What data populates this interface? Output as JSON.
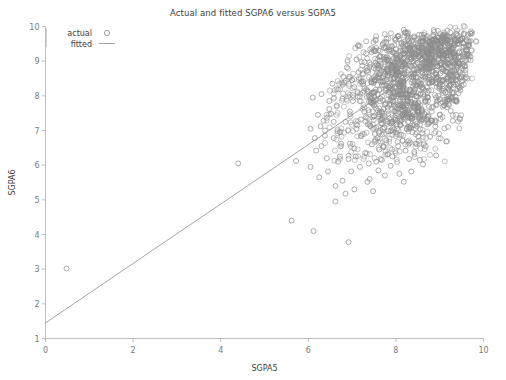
{
  "chart_data": {
    "type": "scatter",
    "title": "Actual and fitted SGPA6 versus SGPA5",
    "xlabel": "SGPA5",
    "ylabel": "SGPA6",
    "xlim": [
      0,
      10
    ],
    "ylim": [
      1,
      10
    ],
    "xticks": [
      0,
      2,
      4,
      6,
      8,
      10
    ],
    "yticks": [
      1,
      2,
      3,
      4,
      5,
      6,
      7,
      8,
      9,
      10
    ],
    "xtick_labels": [
      "0",
      "2",
      "4",
      "6",
      "8",
      "10"
    ],
    "ytick_labels": [
      "1",
      "2",
      "3",
      "4",
      "5",
      "6",
      "7",
      "8",
      "9",
      "10"
    ],
    "grid": false,
    "legend_position": "top-left",
    "marker_color": "#8c8c8c",
    "line_color": "#9a9a9a",
    "axis_color": "#b5b5b5",
    "series": [
      {
        "name": "actual",
        "type": "scatter",
        "marker": "open-circle",
        "points": [
          [
            0.48,
            3.02
          ],
          [
            4.4,
            6.05
          ],
          [
            5.62,
            4.4
          ],
          [
            6.12,
            4.1
          ],
          [
            6.92,
            3.78
          ],
          [
            5.72,
            6.12
          ],
          [
            6.05,
            5.95
          ],
          [
            6.18,
            6.42
          ],
          [
            6.3,
            6.55
          ],
          [
            6.42,
            6.2
          ],
          [
            6.05,
            7.05
          ],
          [
            6.22,
            7.45
          ],
          [
            6.38,
            7.0
          ],
          [
            6.48,
            7.62
          ],
          [
            6.58,
            6.78
          ],
          [
            6.1,
            7.95
          ],
          [
            6.3,
            8.05
          ],
          [
            6.72,
            6.95
          ],
          [
            6.85,
            7.25
          ],
          [
            6.95,
            6.62
          ],
          [
            7.02,
            7.85
          ],
          [
            7.12,
            7.15
          ],
          [
            7.2,
            6.85
          ],
          [
            7.28,
            7.55
          ],
          [
            7.35,
            8.15
          ],
          [
            6.62,
            5.4
          ],
          [
            6.78,
            5.55
          ],
          [
            7.05,
            5.3
          ],
          [
            7.4,
            5.6
          ],
          [
            7.55,
            6.1
          ],
          [
            7.62,
            6.45
          ],
          [
            7.7,
            7.05
          ],
          [
            7.78,
            6.72
          ],
          [
            7.85,
            7.35
          ],
          [
            7.92,
            6.25
          ],
          [
            6.55,
            8.35
          ],
          [
            6.8,
            8.55
          ],
          [
            7.05,
            8.25
          ],
          [
            7.25,
            8.62
          ],
          [
            7.42,
            8.9
          ],
          [
            7.5,
            7.72
          ],
          [
            7.58,
            8.05
          ],
          [
            7.65,
            8.42
          ],
          [
            7.72,
            8.78
          ],
          [
            7.8,
            9.02
          ],
          [
            7.88,
            8.18
          ],
          [
            7.95,
            8.52
          ],
          [
            8.02,
            8.85
          ],
          [
            8.1,
            9.15
          ],
          [
            8.18,
            8.32
          ],
          [
            7.45,
            6.6
          ],
          [
            7.52,
            6.9
          ],
          [
            7.6,
            5.85
          ],
          [
            7.68,
            6.15
          ],
          [
            7.75,
            5.7
          ],
          [
            8.05,
            6.55
          ],
          [
            8.12,
            6.88
          ],
          [
            8.2,
            7.2
          ],
          [
            8.28,
            7.52
          ],
          [
            8.35,
            7.82
          ],
          [
            8.42,
            8.12
          ],
          [
            8.5,
            8.42
          ],
          [
            8.58,
            8.7
          ],
          [
            8.65,
            8.98
          ],
          [
            8.72,
            9.22
          ],
          [
            8.8,
            9.45
          ],
          [
            8.88,
            9.62
          ],
          [
            8.95,
            9.38
          ],
          [
            9.02,
            9.55
          ],
          [
            9.1,
            9.7
          ],
          [
            9.18,
            9.42
          ],
          [
            9.25,
            9.58
          ],
          [
            9.32,
            9.72
          ],
          [
            9.4,
            9.5
          ],
          [
            9.48,
            9.65
          ],
          [
            9.55,
            9.78
          ],
          [
            9.62,
            9.58
          ],
          [
            9.7,
            9.8
          ],
          [
            9.35,
            9.18
          ],
          [
            9.1,
            9.05
          ],
          [
            8.25,
            7.05
          ],
          [
            8.32,
            7.38
          ],
          [
            8.4,
            7.68
          ],
          [
            8.48,
            7.98
          ],
          [
            8.55,
            8.28
          ],
          [
            8.62,
            8.55
          ],
          [
            8.7,
            8.82
          ],
          [
            8.78,
            9.08
          ],
          [
            8.85,
            9.3
          ],
          [
            8.92,
            9.12
          ],
          [
            8.15,
            6.7
          ],
          [
            8.22,
            6.42
          ],
          [
            8.3,
            6.18
          ],
          [
            8.45,
            6.62
          ],
          [
            8.6,
            6.92
          ],
          [
            8.05,
            8.05
          ],
          [
            8.12,
            8.35
          ],
          [
            8.2,
            8.62
          ],
          [
            8.28,
            8.88
          ],
          [
            8.35,
            9.1
          ],
          [
            7.98,
            7.55
          ],
          [
            7.9,
            7.25
          ],
          [
            7.82,
            6.98
          ],
          [
            7.72,
            7.62
          ],
          [
            7.65,
            7.92
          ],
          [
            8.92,
            8.62
          ],
          [
            9.0,
            8.88
          ],
          [
            9.08,
            8.45
          ],
          [
            9.15,
            8.7
          ],
          [
            9.22,
            8.95
          ],
          [
            8.68,
            7.85
          ],
          [
            8.75,
            8.15
          ],
          [
            8.82,
            8.4
          ],
          [
            8.5,
            7.55
          ],
          [
            8.58,
            7.28
          ],
          [
            9.3,
            9.0
          ],
          [
            9.38,
            8.75
          ],
          [
            9.45,
            9.25
          ],
          [
            9.52,
            9.05
          ],
          [
            9.6,
            9.32
          ],
          [
            7.3,
            6.35
          ],
          [
            7.38,
            6.05
          ],
          [
            7.18,
            5.95
          ],
          [
            7.08,
            6.25
          ],
          [
            6.98,
            5.82
          ],
          [
            8.38,
            6.95
          ],
          [
            8.45,
            7.25
          ],
          [
            8.52,
            6.7
          ],
          [
            8.65,
            7.48
          ],
          [
            8.72,
            7.18
          ],
          [
            9.05,
            8.15
          ],
          [
            9.12,
            7.88
          ],
          [
            9.2,
            8.22
          ],
          [
            9.28,
            8.48
          ],
          [
            9.42,
            8.28
          ],
          [
            6.88,
            8.82
          ],
          [
            7.1,
            9.05
          ],
          [
            7.32,
            9.22
          ],
          [
            7.55,
            9.38
          ],
          [
            7.78,
            9.55
          ],
          [
            8.0,
            9.62
          ],
          [
            8.22,
            9.48
          ],
          [
            8.42,
            9.68
          ],
          [
            8.62,
            9.52
          ],
          [
            8.85,
            9.72
          ],
          [
            6.45,
            5.82
          ],
          [
            6.68,
            6.1
          ],
          [
            6.25,
            5.65
          ],
          [
            7.88,
            5.98
          ],
          [
            8.08,
            5.75
          ],
          [
            7.95,
            8.92
          ],
          [
            8.18,
            9.22
          ],
          [
            8.38,
            9.35
          ],
          [
            8.55,
            9.18
          ],
          [
            8.78,
            9.42
          ],
          [
            7.42,
            7.12
          ],
          [
            7.5,
            7.42
          ],
          [
            7.58,
            6.78
          ],
          [
            7.68,
            8.32
          ],
          [
            7.75,
            8.62
          ],
          [
            8.08,
            7.72
          ],
          [
            8.15,
            7.42
          ],
          [
            8.02,
            7.18
          ],
          [
            7.92,
            6.88
          ],
          [
            8.25,
            9.02
          ],
          [
            9.48,
            9.12
          ],
          [
            9.55,
            9.42
          ],
          [
            9.62,
            9.22
          ],
          [
            9.28,
            9.35
          ],
          [
            9.18,
            9.62
          ],
          [
            6.72,
            6.25
          ],
          [
            6.58,
            7.25
          ],
          [
            6.38,
            6.85
          ],
          [
            6.95,
            7.55
          ],
          [
            7.22,
            8.42
          ],
          [
            8.32,
            8.18
          ],
          [
            8.48,
            8.95
          ],
          [
            8.68,
            9.15
          ],
          [
            8.88,
            8.98
          ],
          [
            9.05,
            9.28
          ],
          [
            7.62,
            9.12
          ],
          [
            7.85,
            9.28
          ],
          [
            8.05,
            9.05
          ],
          [
            8.3,
            9.58
          ],
          [
            8.52,
            9.4
          ],
          [
            6.15,
            6.78
          ],
          [
            6.35,
            7.28
          ],
          [
            6.52,
            7.48
          ],
          [
            6.65,
            7.72
          ],
          [
            6.78,
            7.92
          ],
          [
            7.0,
            8.45
          ],
          [
            7.15,
            8.68
          ],
          [
            7.28,
            8.22
          ],
          [
            7.45,
            8.48
          ],
          [
            7.6,
            8.88
          ],
          [
            8.42,
            6.38
          ],
          [
            8.55,
            6.15
          ],
          [
            8.68,
            6.55
          ],
          [
            8.78,
            6.82
          ],
          [
            8.9,
            7.12
          ],
          [
            9.0,
            7.45
          ],
          [
            9.1,
            7.72
          ],
          [
            9.2,
            7.98
          ],
          [
            9.32,
            8.08
          ],
          [
            9.4,
            8.55
          ],
          [
            7.35,
            5.52
          ],
          [
            7.48,
            5.25
          ],
          [
            6.85,
            5.18
          ],
          [
            6.62,
            4.95
          ],
          [
            8.18,
            5.52
          ],
          [
            8.35,
            5.82
          ],
          [
            8.62,
            6.02
          ],
          [
            8.92,
            6.28
          ],
          [
            9.15,
            6.68
          ],
          [
            9.3,
            7.28
          ],
          [
            7.1,
            7.05
          ],
          [
            7.2,
            7.32
          ],
          [
            7.05,
            6.48
          ],
          [
            6.92,
            6.18
          ],
          [
            6.75,
            6.62
          ],
          [
            8.12,
            8.72
          ],
          [
            8.25,
            8.52
          ],
          [
            8.05,
            8.48
          ],
          [
            7.98,
            8.22
          ],
          [
            7.88,
            7.88
          ],
          [
            9.45,
            8.92
          ],
          [
            9.52,
            8.62
          ],
          [
            9.58,
            9.02
          ],
          [
            9.65,
            9.45
          ],
          [
            9.38,
            9.78
          ],
          [
            6.28,
            7.12
          ],
          [
            6.48,
            7.85
          ],
          [
            6.68,
            8.18
          ],
          [
            6.82,
            8.38
          ],
          [
            7.02,
            8.02
          ],
          [
            8.58,
            9.05
          ],
          [
            8.72,
            9.35
          ],
          [
            8.82,
            8.72
          ],
          [
            8.98,
            9.48
          ],
          [
            9.08,
            9.15
          ],
          [
            7.72,
            6.52
          ],
          [
            7.82,
            6.32
          ],
          [
            7.65,
            6.18
          ],
          [
            7.55,
            7.08
          ],
          [
            7.42,
            7.82
          ],
          [
            8.48,
            7.12
          ],
          [
            8.38,
            7.52
          ],
          [
            8.28,
            7.85
          ],
          [
            8.15,
            7.95
          ],
          [
            8.02,
            8.78
          ]
        ]
      },
      {
        "name": "fitted",
        "type": "line",
        "x": [
          0,
          9.8
        ],
        "y": [
          1.45,
          9.85
        ]
      }
    ]
  },
  "legend": {
    "items": [
      {
        "label": "actual",
        "marker": "open-circle"
      },
      {
        "label": "fitted",
        "marker": "line"
      }
    ]
  }
}
